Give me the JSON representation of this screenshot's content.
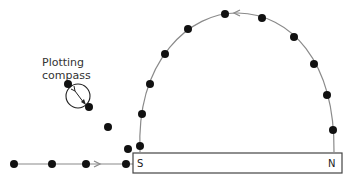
{
  "diagram": {
    "type": "magnetic field line plotting",
    "compass_label_line1": "Plotting",
    "compass_label_line2": "compass",
    "magnet": {
      "south_label": "S",
      "north_label": "N"
    },
    "colors": {
      "line": "#8a8a8a",
      "dot": "#111111",
      "magnet_outline": "#444444"
    },
    "field_lines": [
      {
        "name": "arc-line",
        "direction": "N to S (anticlockwise over top)",
        "dot_count": 11
      },
      {
        "name": "horizontal-line",
        "direction": "toward S pole",
        "dot_count": 4
      }
    ],
    "loose_dots": 4
  }
}
